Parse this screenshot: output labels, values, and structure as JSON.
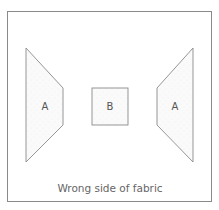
{
  "diagram": {
    "caption": "Wrong side of fabric",
    "colors": {
      "stroke": "#8a8a8a",
      "fill": "#f7f7f7",
      "text": "#666666"
    },
    "pieces": [
      {
        "id": "left-a",
        "label": "A"
      },
      {
        "id": "center-b",
        "label": "B"
      },
      {
        "id": "right-a",
        "label": "A"
      }
    ]
  }
}
